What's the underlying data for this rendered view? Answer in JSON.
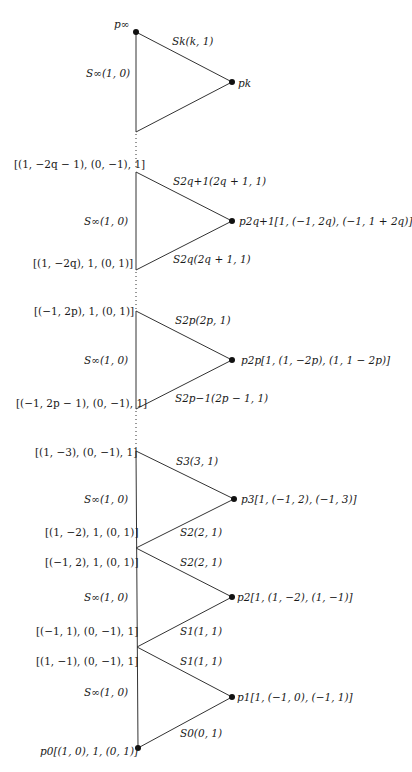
{
  "diagram": {
    "type": "toric-fan-chain",
    "vertices": [
      {
        "id": "p_inf",
        "label": "p∞",
        "x": 136,
        "y": 32
      },
      {
        "id": "p_k",
        "label": "p_k",
        "x": 232,
        "y": 82
      },
      {
        "id": "p_2q+1",
        "label": "p_{2q+1}[1,(−1,2q),(−1,1+2q)]",
        "x": 232,
        "y": 221
      },
      {
        "id": "p_2p",
        "label": "p_{2p}[1,(1,−2p),(1,1−2p)]",
        "x": 232,
        "y": 360
      },
      {
        "id": "p_3",
        "label": "p_3[1,(−1,2),(−1,3)]",
        "x": 234,
        "y": 499
      },
      {
        "id": "p_2",
        "label": "p_2[1,(1,−2),(1,−1)]",
        "x": 232,
        "y": 597
      },
      {
        "id": "p_1",
        "label": "p_1[1,(−1,0),(−1,1)]",
        "x": 232,
        "y": 697
      },
      {
        "id": "p_0",
        "label": "p_0[(1,0),1,(0,1)]",
        "x": 138,
        "y": 748
      }
    ]
  },
  "labels": {
    "p_inf": "p∞",
    "s_k": "Sk(k, 1)",
    "s_inf_1": "S∞(1, 0)",
    "p_k": "pk",
    "top_2q1": "[(1, −2q − 1), (0, −1), 1]",
    "s_2q1": "S2q+1(2q + 1, 1)",
    "s_inf_2": "S∞(1, 0)",
    "p_2q1": "p2q+1[1, (−1, 2q), (−1, 1 + 2q)]",
    "bot_2q": "[(1, −2q), 1, (0, 1)]",
    "s_2q": "S2q(2q + 1, 1)",
    "top_2p": "[(−1, 2p), 1, (0, 1)]",
    "s_2p": "S2p(2p, 1)",
    "s_inf_3": "S∞(1, 0)",
    "p_2p": "p2p[1, (1, −2p), (1, 1 − 2p)]",
    "bot_2p1": "[(−1, 2p − 1), (0, −1), 1]",
    "s_2p1": "S2p−1(2p − 1, 1)",
    "top_3": "[(1, −3), (0, −1), 1]",
    "s_3": "S3(3, 1)",
    "s_inf_4": "S∞(1, 0)",
    "p_3": "p3[1, (−1, 2), (−1, 3)]",
    "j2_upper": "[(1, −2), 1, (0, 1)]",
    "s_2a": "S2(2, 1)",
    "j2_lower": "[(−1, 2), 1, (0, 1)]",
    "s_2b": "S2(2, 1)",
    "s_inf_5": "S∞(1, 0)",
    "p_2": "p2[1, (1, −2), (1, −1)]",
    "j1_upper": "[(−1, 1), (0, −1), 1]",
    "s_1a": "S1(1, 1)",
    "j1_lower": "[(1, −1), (0, −1), 1]",
    "s_1b": "S1(1, 1)",
    "s_inf_6": "S∞(1, 0)",
    "p_1": "p1[1, (−1, 0), (−1, 1)]",
    "s_0": "S0(0, 1)",
    "p_0": "p0[(1, 0), 1, (0, 1)]"
  },
  "colors": {
    "line": "#333333",
    "dot": "#111111",
    "background": "#ffffff"
  }
}
